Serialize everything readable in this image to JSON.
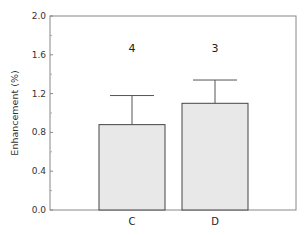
{
  "chart_data": {
    "type": "bar",
    "title": "",
    "xlabel": "",
    "ylabel": "Enhancement (%)",
    "ylim": [
      0.0,
      2.0
    ],
    "yticks": [
      "0.0",
      "0.4",
      "0.8",
      "1.2",
      "1.6",
      "2.0"
    ],
    "ytick_values": [
      0.0,
      0.4,
      0.8,
      1.2,
      1.6,
      2.0
    ],
    "categories": [
      "C",
      "D"
    ],
    "values": [
      0.88,
      1.1
    ],
    "error_upper": [
      1.18,
      1.34
    ],
    "annotations": [
      "4",
      "3"
    ],
    "bar_color": "#e8e8e8",
    "edge_color": "#444444",
    "grid": false
  }
}
